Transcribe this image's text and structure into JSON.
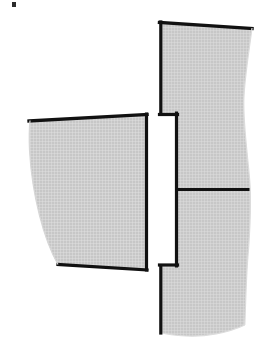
{
  "document": {
    "title": "Pattern Pieces Diagram",
    "background_color": "#ffffff",
    "width": 263,
    "height": 356
  },
  "style": {
    "outline_color": "#111111",
    "outline_width": 3,
    "hatch_fill_color": "#c9c9c9",
    "hatch_line_color": "#ffffff",
    "hatch_background": "#c6c6c6",
    "hatch_spacing": 3,
    "divider_color": "#111111",
    "divider_width": 3,
    "speck_color": "#2b2b2b"
  },
  "shapes": [
    {
      "id": "left-piece",
      "name": "left-pattern-piece",
      "label": "Left panel piece",
      "outline_points": "30,120 147,114 147,270 58,265",
      "path": "M 30 120 L 147 114 L 147 270 L 58 265 C 40 232 28 175 30 120 Z",
      "fill": "hatch",
      "edges": [
        {
          "name": "top-edge",
          "from": [
            30,
            120
          ],
          "to": [
            147,
            114
          ],
          "kind": "straight"
        },
        {
          "name": "right-edge",
          "from": [
            147,
            114
          ],
          "to": [
            147,
            270
          ],
          "kind": "straight"
        },
        {
          "name": "bottom-edge",
          "from": [
            147,
            270
          ],
          "to": [
            58,
            265
          ],
          "kind": "straight"
        },
        {
          "name": "left-edge",
          "from": [
            58,
            265
          ],
          "to": [
            30,
            120
          ],
          "kind": "curved"
        }
      ]
    },
    {
      "id": "right-piece",
      "name": "right-pattern-piece",
      "label": "Right panel piece with notch",
      "path": "M 160 22 L 252 28 C 248 60 243 85 244 104 C 246 130 251 160 250 190 C 249 225 245 265 246 300 C 246 312 246 320 245 326 C 215 338 185 338 160 332 L 160 266 L 176 266 L 176 113 L 160 113 Z",
      "fill": "hatch",
      "edges": [
        {
          "name": "top-edge",
          "from": [
            160,
            22
          ],
          "to": [
            252,
            28
          ],
          "kind": "straight"
        },
        {
          "name": "right-edge",
          "from": [
            252,
            28
          ],
          "to": [
            245,
            326
          ],
          "kind": "wavy"
        },
        {
          "name": "bottom-edge",
          "from": [
            245,
            326
          ],
          "to": [
            160,
            332
          ],
          "kind": "curved"
        },
        {
          "name": "lower-left-edge",
          "from": [
            160,
            332
          ],
          "to": [
            160,
            266
          ],
          "kind": "straight"
        },
        {
          "name": "notch-bottom-edge",
          "from": [
            160,
            266
          ],
          "to": [
            176,
            266
          ],
          "kind": "straight"
        },
        {
          "name": "notch-inner-edge",
          "from": [
            176,
            266
          ],
          "to": [
            176,
            113
          ],
          "kind": "straight"
        },
        {
          "name": "notch-top-edge",
          "from": [
            176,
            113
          ],
          "to": [
            160,
            113
          ],
          "kind": "straight"
        },
        {
          "name": "upper-left-edge",
          "from": [
            160,
            113
          ],
          "to": [
            160,
            22
          ],
          "kind": "straight"
        }
      ]
    }
  ],
  "divider": {
    "name": "horizontal-divider-line",
    "from": [
      176,
      190
    ],
    "to": [
      249,
      190
    ],
    "label": "Seam division line"
  },
  "marks": [
    {
      "name": "corner-speck-mark",
      "x": 12,
      "y": 2,
      "width": 4,
      "height": 5,
      "label": "Stray ink speck"
    }
  ]
}
